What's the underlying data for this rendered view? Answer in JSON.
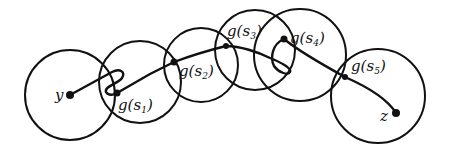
{
  "diagram": {
    "labels": {
      "start": "y",
      "end": "z",
      "g1": {
        "func": "g",
        "arg": "s",
        "sub": "1"
      },
      "g2": {
        "func": "g",
        "arg": "s",
        "sub": "2"
      },
      "g3": {
        "func": "g",
        "arg": "s",
        "sub": "3"
      },
      "g4": {
        "func": "g",
        "arg": "s",
        "sub": "4"
      },
      "g5": {
        "func": "g",
        "arg": "s",
        "sub": "5"
      }
    },
    "paren_open": "(",
    "paren_close": ")",
    "circles": [
      {
        "cx": 70,
        "cy": 95,
        "r": 45
      },
      {
        "cx": 140,
        "cy": 82,
        "r": 41
      },
      {
        "cx": 201,
        "cy": 65,
        "r": 37
      },
      {
        "cx": 255,
        "cy": 50,
        "r": 40
      },
      {
        "cx": 300,
        "cy": 55,
        "r": 46
      },
      {
        "cx": 378,
        "cy": 96,
        "r": 47
      }
    ],
    "points": [
      {
        "name": "y",
        "x": 70,
        "y": 95
      },
      {
        "name": "g(s1)",
        "x": 117,
        "y": 93
      },
      {
        "name": "g(s2)",
        "x": 174,
        "y": 62
      },
      {
        "name": "g(s3)",
        "x": 226,
        "y": 46
      },
      {
        "name": "g(s4)",
        "x": 284,
        "y": 39
      },
      {
        "name": "g(s5)",
        "x": 345,
        "y": 77
      },
      {
        "name": "z",
        "x": 396,
        "y": 113
      }
    ]
  }
}
